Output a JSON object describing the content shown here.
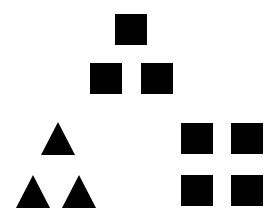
{
  "figure": {
    "canvas": {
      "width": 275,
      "height": 218,
      "background_color": "#ffffff"
    },
    "shape_color": "#000000",
    "groups": [
      {
        "id": "top-square-pyramid",
        "label": "Pyramid of squares",
        "shape_type": "square",
        "count": 3,
        "arrangement": "pyramid-1-2",
        "shapes": [
          {
            "name": "square-top-apex",
            "type": "square",
            "x": 115,
            "y": 14,
            "width": 32,
            "height": 31
          },
          {
            "name": "square-row2-left",
            "type": "square",
            "x": 90,
            "y": 63,
            "width": 32,
            "height": 31
          },
          {
            "name": "square-row2-right",
            "type": "square",
            "x": 141,
            "y": 63,
            "width": 32,
            "height": 31
          }
        ]
      },
      {
        "id": "bottom-left-triangle-pyramid",
        "label": "Pyramid of triangles",
        "shape_type": "triangle",
        "count": 3,
        "arrangement": "pyramid-1-2",
        "shapes": [
          {
            "name": "triangle-top-apex",
            "type": "triangle",
            "x": 41,
            "y": 122,
            "width": 34,
            "height": 33
          },
          {
            "name": "triangle-row2-left",
            "type": "triangle",
            "x": 16,
            "y": 175,
            "width": 34,
            "height": 33
          },
          {
            "name": "triangle-row2-right",
            "type": "triangle",
            "x": 62,
            "y": 175,
            "width": 34,
            "height": 33
          }
        ]
      },
      {
        "id": "bottom-right-square-grid",
        "label": "Two by two grid of squares",
        "shape_type": "square",
        "count": 4,
        "arrangement": "grid-2x2",
        "shapes": [
          {
            "name": "grid-square-top-left",
            "type": "square",
            "x": 181,
            "y": 123,
            "width": 32,
            "height": 31
          },
          {
            "name": "grid-square-top-right",
            "type": "square",
            "x": 231,
            "y": 123,
            "width": 32,
            "height": 31
          },
          {
            "name": "grid-square-bottom-left",
            "type": "square",
            "x": 181,
            "y": 175,
            "width": 32,
            "height": 31
          },
          {
            "name": "grid-square-bottom-right",
            "type": "square",
            "x": 231,
            "y": 175,
            "width": 32,
            "height": 31
          }
        ]
      }
    ]
  }
}
